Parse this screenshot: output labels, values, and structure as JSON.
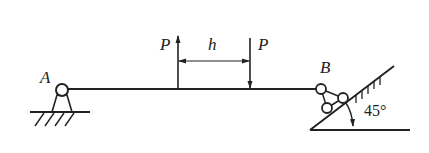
{
  "diagram": {
    "type": "beam-statics",
    "colors": {
      "stroke": "#222222",
      "background": "#ffffff"
    },
    "labels": {
      "support_a": "A",
      "support_b": "B",
      "force_left": "P",
      "force_right": "P",
      "distance": "h",
      "angle": "45°"
    },
    "elements": {
      "beam": "horizontal beam from A to B",
      "support_a": "fixed pin support on hatched ground",
      "support_b": "roller support on 45° inclined surface",
      "force_left": "upward force P",
      "force_right": "downward force P",
      "dimension": "distance h between the two forces"
    }
  }
}
